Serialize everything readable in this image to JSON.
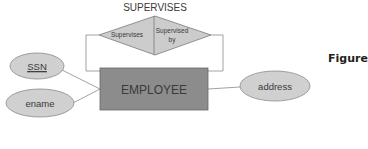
{
  "diagram": {
    "type": "ER diagram",
    "relationship": {
      "name": "SUPERVISES",
      "roles": [
        "Supervises",
        "Supervised by"
      ],
      "role_left": "Supervises",
      "role_right_line1": "Supervised",
      "role_right_line2": "by"
    },
    "entity": {
      "name": "EMPLOYEE"
    },
    "attributes": [
      {
        "name": "SSN",
        "key": true
      },
      {
        "name": "ename",
        "key": false
      },
      {
        "name": "address",
        "key": false
      }
    ],
    "attr_ssn": "SSN",
    "attr_ename": "ename",
    "attr_address": "address",
    "caption": "Figure",
    "colors": {
      "entity_fill": "#8c8c8c",
      "shape_fill": "#cfcfcf",
      "stroke": "#7a7a7a",
      "text": "#3a3a3a"
    }
  }
}
